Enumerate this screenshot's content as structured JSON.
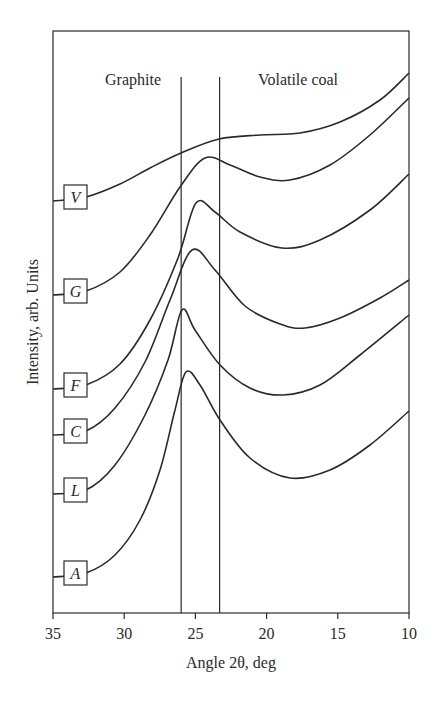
{
  "chart_data": {
    "type": "line",
    "title": "",
    "xlabel": "Angle 2θ, deg",
    "ylabel": "Intensity, arb. Units",
    "xlim": [
      35,
      10
    ],
    "x_ticks": [
      "35",
      "30",
      "25",
      "20",
      "15",
      "10"
    ],
    "x_tick_values": [
      35,
      30,
      25,
      20,
      15,
      10
    ],
    "grid": false,
    "annotations": [
      {
        "text": "Graphite",
        "region": "left of 26°"
      },
      {
        "text": "Volatile coal",
        "region": "right of 23.3°"
      }
    ],
    "vertical_lines": [
      26.0,
      23.3
    ],
    "legend_position": "inline boxed labels at left of each curve",
    "series": [
      {
        "name": "V",
        "points_px": [
          [
            53,
            201
          ],
          [
            86,
            197
          ],
          [
            120,
            184
          ],
          [
            150,
            168
          ],
          [
            181,
            153
          ],
          [
            219,
            139
          ],
          [
            260,
            135
          ],
          [
            300,
            133
          ],
          [
            340,
            122
          ],
          [
            380,
            100
          ],
          [
            409,
            73
          ]
        ]
      },
      {
        "name": "G",
        "points_px": [
          [
            53,
            295
          ],
          [
            86,
            291
          ],
          [
            120,
            272
          ],
          [
            150,
            235
          ],
          [
            180,
            187
          ],
          [
            205,
            158
          ],
          [
            230,
            165
          ],
          [
            260,
            177
          ],
          [
            290,
            180
          ],
          [
            330,
            165
          ],
          [
            370,
            135
          ],
          [
            409,
            98
          ]
        ]
      },
      {
        "name": "F",
        "points_px": [
          [
            53,
            389
          ],
          [
            86,
            385
          ],
          [
            120,
            364
          ],
          [
            150,
            320
          ],
          [
            178,
            258
          ],
          [
            196,
            203
          ],
          [
            215,
            212
          ],
          [
            240,
            232
          ],
          [
            282,
            248
          ],
          [
            320,
            240
          ],
          [
            370,
            210
          ],
          [
            409,
            174
          ]
        ]
      },
      {
        "name": "C",
        "points_px": [
          [
            53,
            435
          ],
          [
            86,
            431
          ],
          [
            115,
            408
          ],
          [
            145,
            362
          ],
          [
            170,
            300
          ],
          [
            192,
            250
          ],
          [
            215,
            270
          ],
          [
            245,
            306
          ],
          [
            280,
            324
          ],
          [
            305,
            328
          ],
          [
            340,
            318
          ],
          [
            380,
            298
          ],
          [
            409,
            280
          ]
        ]
      },
      {
        "name": "L",
        "points_px": [
          [
            53,
            494
          ],
          [
            86,
            490
          ],
          [
            115,
            465
          ],
          [
            145,
            415
          ],
          [
            168,
            360
          ],
          [
            182,
            310
          ],
          [
            195,
            330
          ],
          [
            220,
            365
          ],
          [
            250,
            388
          ],
          [
            283,
            395
          ],
          [
            320,
            385
          ],
          [
            360,
            355
          ],
          [
            409,
            315
          ]
        ]
      },
      {
        "name": "A",
        "points_px": [
          [
            53,
            577
          ],
          [
            86,
            573
          ],
          [
            115,
            555
          ],
          [
            140,
            520
          ],
          [
            160,
            470
          ],
          [
            175,
            410
          ],
          [
            186,
            372
          ],
          [
            200,
            385
          ],
          [
            220,
            420
          ],
          [
            250,
            458
          ],
          [
            290,
            478
          ],
          [
            330,
            470
          ],
          [
            370,
            445
          ],
          [
            409,
            411
          ]
        ]
      }
    ],
    "approx_peak_positions_deg": {
      "V": "shoulder ~23",
      "G": "24.5",
      "F": "25",
      "C": "25.8",
      "L": "26",
      "A": "26"
    }
  },
  "labels": {
    "graphite": "Graphite",
    "volatile": "Volatile coal",
    "xlabel": "Angle 2θ, deg",
    "ylabel": "Intensity, arb. Units"
  }
}
